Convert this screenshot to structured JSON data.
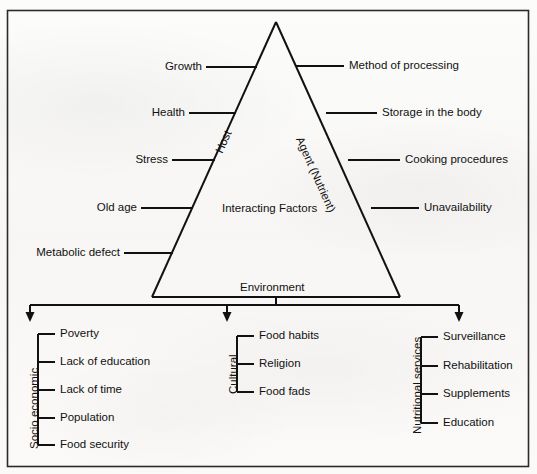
{
  "diagram": {
    "center_label": "Interacting Factors",
    "apex_blank": "",
    "side_labels": {
      "left_edge": "Host",
      "right_edge": "Agent (Nutrient)",
      "base": "Environment"
    },
    "host_factors": [
      "Growth",
      "Health",
      "Stress",
      "Old age",
      "Metabolic defect"
    ],
    "agent_factors": [
      "Method of processing",
      "Storage in the body",
      "Cooking procedures",
      "Unavailability"
    ],
    "environment_branches": [
      {
        "title": "Socio economic",
        "items": [
          "Poverty",
          "Lack of education",
          "Lack of time",
          "Population",
          "Food security"
        ]
      },
      {
        "title": "Cultural",
        "items": [
          "Food habits",
          "Religion",
          "Food fads"
        ]
      },
      {
        "title": "Nutritional services",
        "items": [
          "Surveillance",
          "Rehabilitation",
          "Supplements",
          "Education"
        ]
      }
    ],
    "colors": {
      "ink": "#111111",
      "paper": "#fbfbfa",
      "border": "#2b2b2b"
    }
  }
}
